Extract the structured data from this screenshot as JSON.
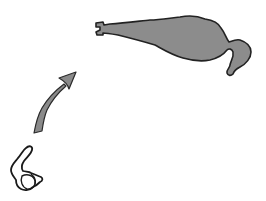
{
  "diagram": {
    "type": "transformation-illustration",
    "elements": [
      {
        "id": "small-form",
        "description": "small curled outlined shape (initial stage)",
        "fill": "#ffffff",
        "stroke": "#1a1a1a"
      },
      {
        "id": "arrow",
        "description": "curved arrow pointing up and to the right",
        "fill": "#8a8a8a",
        "stroke": "#2a2a2a"
      },
      {
        "id": "large-form",
        "description": "large elongated gray shape (later stage)",
        "fill": "#8c8c8c",
        "stroke": "#222222"
      }
    ]
  },
  "colors": {
    "background": "#ffffff",
    "shape_fill": "#8c8c8c",
    "outline": "#222222"
  }
}
